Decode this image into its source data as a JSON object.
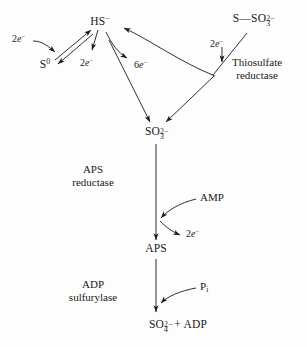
{
  "figure": {
    "type": "biochemical-pathway-diagram",
    "background_color": "#fdfdfd",
    "ink_color": "#1a1a1a"
  },
  "nodes": {
    "sulfide": {
      "label": "HS−",
      "formula_main": "HS",
      "charge": "−"
    },
    "elemental_sulfur": {
      "label": "S0",
      "formula_main": "S",
      "charge": "0"
    },
    "thiosulfate": {
      "label": "S—SO32−",
      "formula_main": "S—SO",
      "sub": "3",
      "sup": "2−"
    },
    "sulfite": {
      "label": "SO32−",
      "formula_main": "SO",
      "sub": "3",
      "sup": "2−"
    },
    "aps": {
      "label": "APS"
    },
    "product": {
      "label": "SO42− + ADP",
      "formula_main": "SO",
      "sub": "4",
      "sup": "2−",
      "tail": " + ADP"
    }
  },
  "enzymes": {
    "thiosulfate_reductase": {
      "line1": "Thiosulfate",
      "line2": "reductase"
    },
    "aps_reductase": {
      "line1": "APS",
      "line2": "reductase"
    },
    "adp_sulfurylase": {
      "line1": "ADP",
      "line2": "sulfurylase"
    }
  },
  "cofactors": {
    "amp": {
      "label": "AMP"
    },
    "phosphate": {
      "label": "Pi",
      "main": "P",
      "sub": "i"
    }
  },
  "electrons": {
    "e_left_in": {
      "count": "2",
      "label": "2e−"
    },
    "e_sulfur_out": {
      "count": "2",
      "label": "2e−"
    },
    "e_six": {
      "count": "6",
      "label": "6e−"
    },
    "e_thiosulfate": {
      "count": "2",
      "label": "2e−"
    },
    "e_aps": {
      "count": "2",
      "label": "2e−"
    }
  }
}
